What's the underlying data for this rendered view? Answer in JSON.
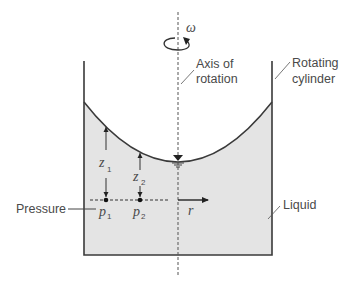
{
  "diagram": {
    "labels": {
      "omega": "ω",
      "axis_line1": "Axis of",
      "axis_line2": "rotation",
      "cylinder_line1": "Rotating",
      "cylinder_line2": "cylinder",
      "liquid": "Liquid",
      "pressure": "Pressure",
      "z1_main": "z",
      "z1_sub": "1",
      "z2_main": "z",
      "z2_sub": "2",
      "p1_main": "p",
      "p1_sub": "1",
      "p2_main": "p",
      "p2_sub": "2",
      "r": "r"
    },
    "colors": {
      "liquid_fill": "#e4e4e4",
      "stroke": "#3a3a3a",
      "text": "#4a4a4a"
    }
  }
}
